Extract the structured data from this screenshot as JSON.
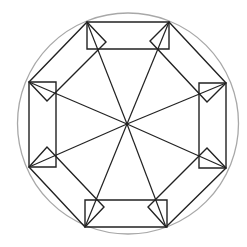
{
  "canvas": {
    "width": 247,
    "height": 247,
    "background": "#ffffff"
  },
  "colors": {
    "circle": "#a8a8a8",
    "line": "#222222"
  },
  "circle": {
    "cx": 128,
    "cy": 123.5,
    "r": 110.5
  },
  "center": {
    "x": 127,
    "y": 124
  },
  "vertices": [
    {
      "name": "top-left",
      "x": 87,
      "y": 22
    },
    {
      "name": "top-right",
      "x": 169,
      "y": 22
    },
    {
      "name": "right-top",
      "x": 226,
      "y": 83
    },
    {
      "name": "right-bottom",
      "x": 226,
      "y": 168
    },
    {
      "name": "bottom-right",
      "x": 166,
      "y": 227
    },
    {
      "name": "bottom-left",
      "x": 85,
      "y": 227
    },
    {
      "name": "left-bottom",
      "x": 29,
      "y": 167
    },
    {
      "name": "left-top",
      "x": 29,
      "y": 82
    }
  ],
  "axis_rectangles": [
    {
      "name": "top-rect",
      "points": [
        [
          87,
          22
        ],
        [
          169,
          22
        ],
        [
          169,
          49
        ],
        [
          87,
          49
        ]
      ]
    },
    {
      "name": "right-rect",
      "points": [
        [
          199,
          83
        ],
        [
          226,
          83
        ],
        [
          226,
          168
        ],
        [
          199,
          168
        ]
      ]
    },
    {
      "name": "bottom-rect",
      "points": [
        [
          85,
          200
        ],
        [
          167,
          200
        ],
        [
          167,
          227
        ],
        [
          85,
          227
        ]
      ]
    },
    {
      "name": "left-rect",
      "points": [
        [
          29,
          82
        ],
        [
          56,
          82
        ],
        [
          56,
          167
        ],
        [
          29,
          167
        ]
      ]
    }
  ],
  "diagonal_rectangles": [
    {
      "name": "top-left-diag-rect",
      "points": [
        [
          87,
          22
        ],
        [
          29,
          82
        ],
        [
          47,
          101
        ],
        [
          106,
          42
        ]
      ]
    },
    {
      "name": "top-right-diag-rect",
      "points": [
        [
          169,
          22
        ],
        [
          226,
          83
        ],
        [
          207,
          102
        ],
        [
          150,
          41
        ]
      ]
    },
    {
      "name": "bottom-right-diag-rect",
      "points": [
        [
          226,
          168
        ],
        [
          166,
          227
        ],
        [
          148,
          207
        ],
        [
          207,
          148
        ]
      ]
    },
    {
      "name": "bottom-left-diag-rect",
      "points": [
        [
          29,
          167
        ],
        [
          85,
          227
        ],
        [
          104,
          207
        ],
        [
          47,
          147
        ]
      ]
    }
  ]
}
